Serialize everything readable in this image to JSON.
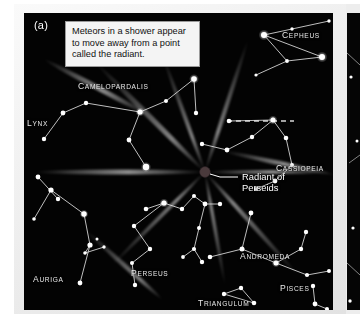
{
  "figure": {
    "panel_letter": "(a)",
    "background_color": "#030303",
    "paper_color": "#f0f0f0"
  },
  "callout": {
    "text": "Meteors in a shower appear to move away from a point called the radiant.",
    "box_color": "#f4f4f4",
    "border_color": "#9a9a9a",
    "text_color": "#111111"
  },
  "radiant": {
    "label_line1": "Radiant of",
    "label_line2": "Perseids",
    "dot_color": "#4a3a3c",
    "x": 181,
    "y": 159
  },
  "constellations": [
    {
      "name": "Cepheus",
      "label": "Cepheus",
      "x": 282,
      "y": 30
    },
    {
      "name": "Camelopardalis",
      "label": "Camelopardalis",
      "x": 78,
      "y": 81
    },
    {
      "name": "Lynx",
      "label": "Lynx",
      "x": 27,
      "y": 118
    },
    {
      "name": "Cassiopeia",
      "label": "Cassiopeia",
      "x": 282,
      "y": 163
    },
    {
      "name": "Auriga",
      "label": "Auriga",
      "x": 33,
      "y": 274
    },
    {
      "name": "Perseus",
      "label": "Perseus",
      "x": 131,
      "y": 268
    },
    {
      "name": "Andromeda",
      "label": "Andromeda",
      "x": 240,
      "y": 251
    },
    {
      "name": "Pisces",
      "label": "Pisces",
      "x": 280,
      "y": 283
    },
    {
      "name": "Triangulum",
      "label": "Triangulum",
      "x": 198,
      "y": 298
    }
  ],
  "chart_data": {
    "type": "scatter",
    "xlabel": "",
    "ylabel": "",
    "xlim": [
      0,
      309
    ],
    "ylim": [
      0,
      297
    ],
    "grid": false,
    "legend": "none",
    "annotations": [
      "Meteors in a shower appear to move away from a point called the radiant.",
      "Radiant of Perseids"
    ],
    "radiant_point": {
      "x": 181,
      "y": 159,
      "label": "Radiant of Perseids"
    },
    "series": [
      {
        "name": "Cepheus",
        "stars": [
          [
            240,
            22
          ],
          [
            268,
            16
          ],
          [
            305,
            8
          ],
          [
            298,
            44
          ],
          [
            263,
            48
          ],
          [
            232,
            62
          ]
        ],
        "links": [
          [
            0,
            1
          ],
          [
            1,
            2
          ],
          [
            0,
            3
          ],
          [
            3,
            4
          ],
          [
            4,
            0
          ],
          [
            4,
            5
          ]
        ]
      },
      {
        "name": "Camelopardalis",
        "stars": [
          [
            116,
            99
          ],
          [
            142,
            88
          ],
          [
            170,
            66
          ],
          [
            105,
            127
          ],
          [
            122,
            154
          ],
          [
            62,
            90
          ],
          [
            39,
            100
          ]
        ],
        "links": [
          [
            5,
            6
          ],
          [
            5,
            0
          ],
          [
            0,
            1
          ],
          [
            1,
            2
          ],
          [
            3,
            0
          ],
          [
            3,
            4
          ]
        ]
      },
      {
        "name": "Lynx",
        "stars": [
          [
            39,
            100
          ],
          [
            20,
            126
          ],
          [
            14,
            164
          ],
          [
            34,
            186
          ]
        ],
        "links": [
          [
            0,
            1
          ],
          [
            2,
            3
          ]
        ]
      },
      {
        "name": "Cassiopeia",
        "stars": [
          [
            205,
            108
          ],
          [
            249,
            107
          ],
          [
            228,
            124
          ],
          [
            203,
            137
          ],
          [
            178,
            131
          ],
          [
            262,
            125
          ],
          [
            268,
            152
          ],
          [
            251,
            168
          ]
        ],
        "links": [
          [
            0,
            1
          ],
          [
            1,
            2
          ],
          [
            2,
            3
          ],
          [
            3,
            4
          ],
          [
            1,
            5
          ],
          [
            5,
            6
          ],
          [
            6,
            7
          ]
        ]
      },
      {
        "name": "Auriga",
        "stars": [
          [
            27,
            177
          ],
          [
            60,
            201
          ],
          [
            66,
            232
          ],
          [
            61,
            240
          ],
          [
            80,
            234
          ],
          [
            56,
            270
          ],
          [
            10,
            206
          ]
        ],
        "links": [
          [
            0,
            1
          ],
          [
            1,
            2
          ],
          [
            2,
            3
          ],
          [
            3,
            4
          ],
          [
            2,
            5
          ],
          [
            0,
            6
          ]
        ]
      },
      {
        "name": "Perseus",
        "stars": [
          [
            140,
            190
          ],
          [
            122,
            196
          ],
          [
            110,
            213
          ],
          [
            126,
            236
          ],
          [
            108,
            250
          ],
          [
            111,
            272
          ],
          [
            158,
            196
          ],
          [
            170,
            183
          ],
          [
            181,
            191
          ],
          [
            196,
            191
          ],
          [
            175,
            215
          ],
          [
            170,
            236
          ],
          [
            159,
            244
          ],
          [
            178,
            249
          ]
        ],
        "links": [
          [
            1,
            0
          ],
          [
            0,
            2
          ],
          [
            2,
            3
          ],
          [
            3,
            4
          ],
          [
            4,
            5
          ],
          [
            0,
            6
          ],
          [
            6,
            7
          ],
          [
            7,
            8
          ],
          [
            8,
            9
          ],
          [
            8,
            10
          ],
          [
            10,
            11
          ],
          [
            11,
            12
          ],
          [
            11,
            13
          ]
        ]
      },
      {
        "name": "Andromeda",
        "stars": [
          [
            227,
            200
          ],
          [
            218,
            236
          ],
          [
            186,
            244
          ],
          [
            252,
            250
          ],
          [
            277,
            236
          ],
          [
            282,
            219
          ],
          [
            283,
            262
          ],
          [
            305,
            258
          ]
        ],
        "links": [
          [
            0,
            1
          ],
          [
            1,
            2
          ],
          [
            1,
            3
          ],
          [
            3,
            4
          ],
          [
            4,
            5
          ],
          [
            3,
            6
          ],
          [
            6,
            7
          ]
        ]
      },
      {
        "name": "Triangulum",
        "stars": [
          [
            200,
            281
          ],
          [
            217,
            275
          ],
          [
            230,
            290
          ]
        ],
        "links": [
          [
            0,
            1
          ],
          [
            0,
            2
          ],
          [
            1,
            2
          ]
        ]
      },
      {
        "name": "Pisces",
        "stars": [
          [
            289,
            273
          ],
          [
            291,
            291
          ],
          [
            303,
            296
          ]
        ],
        "links": [
          [
            0,
            1
          ],
          [
            1,
            2
          ]
        ]
      }
    ],
    "meteor_streaks": [
      {
        "angle_deg": 180,
        "length": 170,
        "note": "horizontal streak left of radiant"
      },
      {
        "angle_deg": 0,
        "length": 120,
        "note": "horizontal streak right of radiant"
      },
      {
        "angle_deg": 225,
        "length": 150,
        "note": "streak toward lower-left"
      },
      {
        "angle_deg": 45,
        "length": 120,
        "note": "streak toward upper-right"
      },
      {
        "angle_deg": 135,
        "length": 130,
        "note": "streak toward upper-left"
      },
      {
        "angle_deg": 250,
        "length": 110,
        "note": "streak toward lower-left steep"
      },
      {
        "angle_deg": 290,
        "length": 120,
        "note": "streak toward lower-right"
      }
    ],
    "guide_line": {
      "style": "dashed",
      "from": [
        203,
        108
      ],
      "to": [
        270,
        108
      ],
      "color": "#d8d8d8"
    }
  }
}
